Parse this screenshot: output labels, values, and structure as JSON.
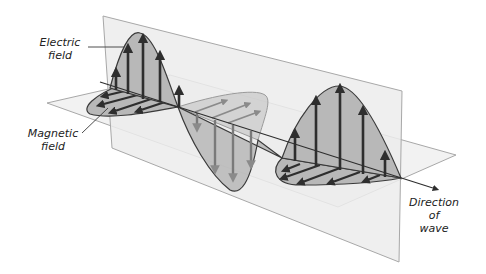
{
  "figure": {
    "type": "electromagnetic-wave-diagram",
    "labels": {
      "electric_field": [
        "Electric",
        "field"
      ],
      "magnetic_field": [
        "Magnetic",
        "field"
      ],
      "direction_of_wave": [
        "Direction",
        "of",
        "wave"
      ]
    },
    "colors": {
      "plane_fill": "#efefef",
      "plane_edge": "#a8a8a8",
      "wave_fill": "#b8b8b8",
      "wave_outline": "#3a3a3a",
      "arrow_dark": "#2e2e2e",
      "arrow_faded": "#8a8a8a",
      "text": "#222222"
    }
  }
}
